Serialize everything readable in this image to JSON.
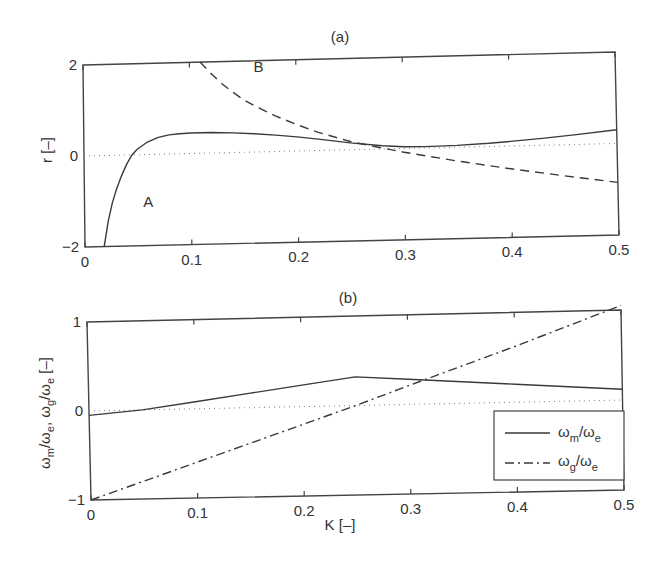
{
  "figure": {
    "panel_a_title": "(a)",
    "panel_b_title": "(b)"
  },
  "chart_data": [
    {
      "type": "line",
      "title": "(a)",
      "xlabel": "",
      "ylabel": "r [–]",
      "xlim": [
        0,
        0.5
      ],
      "ylim": [
        -2,
        2
      ],
      "xticks": [
        "0",
        "0.1",
        "0.2",
        "0.3",
        "0.4",
        "0.5"
      ],
      "yticks": [
        "-2",
        "0",
        "2"
      ],
      "grid": false,
      "reference_line": {
        "y": 0,
        "style": "dotted"
      },
      "annotations": [
        {
          "text": "A",
          "x": 0.055,
          "y": -1.15
        },
        {
          "text": "B",
          "x": 0.16,
          "y": 1.75
        }
      ],
      "series": [
        {
          "name": "A",
          "style": "solid",
          "x": [
            0.018,
            0.022,
            0.026,
            0.03,
            0.035,
            0.04,
            0.045,
            0.05,
            0.06,
            0.07,
            0.08,
            0.09,
            0.1,
            0.11,
            0.12,
            0.14,
            0.16,
            0.18,
            0.2,
            0.22,
            0.25,
            0.28,
            0.3,
            0.32,
            0.35,
            0.38,
            0.4,
            0.43,
            0.46,
            0.5
          ],
          "y": [
            -2.0,
            -1.45,
            -1.05,
            -0.75,
            -0.45,
            -0.2,
            0.0,
            0.12,
            0.28,
            0.37,
            0.42,
            0.44,
            0.45,
            0.45,
            0.45,
            0.43,
            0.4,
            0.36,
            0.31,
            0.25,
            0.15,
            0.07,
            0.04,
            0.03,
            0.04,
            0.07,
            0.1,
            0.15,
            0.21,
            0.3
          ]
        },
        {
          "name": "B",
          "style": "dashed",
          "x": [
            0.11,
            0.12,
            0.13,
            0.14,
            0.15,
            0.16,
            0.18,
            0.2,
            0.22,
            0.25,
            0.28,
            0.3,
            0.35,
            0.4,
            0.45,
            0.5
          ],
          "y": [
            2.0,
            1.75,
            1.52,
            1.33,
            1.16,
            1.02,
            0.78,
            0.58,
            0.4,
            0.18,
            0.02,
            -0.08,
            -0.3,
            -0.5,
            -0.68,
            -0.85
          ]
        }
      ]
    },
    {
      "type": "line",
      "title": "(b)",
      "xlabel": "K [–]",
      "ylabel": "ωm/ωe, ωg/ωe [–]",
      "xlim": [
        0,
        0.5
      ],
      "ylim": [
        -1,
        1
      ],
      "xticks": [
        "0",
        "0.1",
        "0.2",
        "0.3",
        "0.4",
        "0.5"
      ],
      "yticks": [
        "-1",
        "0",
        "1"
      ],
      "grid": false,
      "legend_position": "lower right",
      "reference_line": {
        "y": 0,
        "style": "dotted"
      },
      "series": [
        {
          "name": "ωm/ωe",
          "legend_main": "ω",
          "legend_sub1": "m",
          "legend_mid": "/ω",
          "legend_sub2": "e",
          "style": "solid",
          "x": [
            0,
            0.05,
            0.1,
            0.15,
            0.2,
            0.25,
            0.3,
            0.35,
            0.4,
            0.45,
            0.5
          ],
          "y": [
            -0.05,
            0.0,
            0.08,
            0.16,
            0.24,
            0.32,
            0.28,
            0.24,
            0.2,
            0.16,
            0.12
          ]
        },
        {
          "name": "ωg/ωe",
          "legend_main": "ω",
          "legend_sub1": "g",
          "legend_mid": "/ω",
          "legend_sub2": "e",
          "style": "dashdot",
          "x": [
            0,
            0.1,
            0.2,
            0.25,
            0.3,
            0.4,
            0.5
          ],
          "y": [
            -1.0,
            -0.6,
            -0.2,
            0.0,
            0.21,
            0.62,
            1.05
          ]
        }
      ]
    }
  ],
  "axis_labels": {
    "a_ylabel": "r [–]",
    "b_ylabel_main": "ω",
    "b_xlabel": "K [–]"
  },
  "colors": {
    "line": "#3a3a3a",
    "axis": "#444444",
    "background": "#ffffff"
  }
}
